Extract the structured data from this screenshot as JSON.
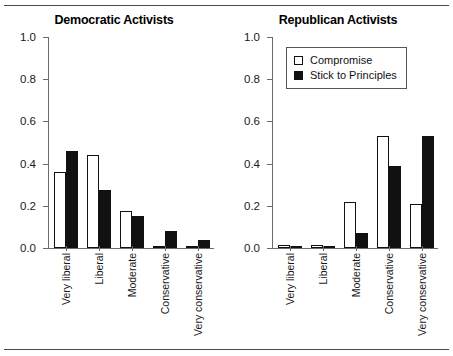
{
  "figure": {
    "rule_top": "horizontal-rule",
    "rule_bottom": "horizontal-rule"
  },
  "chart_data": [
    {
      "type": "bar",
      "title": "Democratic Activists",
      "xlabel": "",
      "ylabel": "",
      "ylim": [
        0.0,
        1.0
      ],
      "yticks": [
        "0.0",
        "0.2",
        "0.4",
        "0.6",
        "0.8",
        "1.0"
      ],
      "ytick_values": [
        0.0,
        0.2,
        0.4,
        0.6,
        0.8,
        1.0
      ],
      "grid": false,
      "legend": false,
      "categories": [
        "Very liberal",
        "Liberal",
        "Moderate",
        "Conservative",
        "Very conservative"
      ],
      "series": [
        {
          "name": "Compromise",
          "fill": "open",
          "values": [
            0.36,
            0.44,
            0.175,
            0.01,
            0.01
          ]
        },
        {
          "name": "Stick to Principles",
          "fill": "solid",
          "values": [
            0.46,
            0.275,
            0.15,
            0.08,
            0.04
          ]
        }
      ]
    },
    {
      "type": "bar",
      "title": "Republican Activists",
      "xlabel": "",
      "ylabel": "",
      "ylim": [
        0.0,
        1.0
      ],
      "yticks": [
        "0.0",
        "0.2",
        "0.4",
        "0.6",
        "0.8",
        "1.0"
      ],
      "ytick_values": [
        0.0,
        0.2,
        0.4,
        0.6,
        0.8,
        1.0
      ],
      "grid": false,
      "legend": true,
      "legend_position": "top-left",
      "legend_entries": [
        "Compromise",
        "Stick to Principles"
      ],
      "categories": [
        "Very liberal",
        "Liberal",
        "Moderate",
        "Conservative",
        "Very conservative"
      ],
      "series": [
        {
          "name": "Compromise",
          "fill": "open",
          "values": [
            0.012,
            0.012,
            0.22,
            0.53,
            0.21
          ]
        },
        {
          "name": "Stick to Principles",
          "fill": "solid",
          "values": [
            0.006,
            0.006,
            0.07,
            0.39,
            0.53
          ]
        }
      ]
    }
  ],
  "colors": {
    "open_fill": "#ffffff",
    "solid_fill": "#111111",
    "bar_edge": "#111111",
    "axis": "#6b6b6b",
    "text": "#1a1a1a",
    "rule": "#4a4a4a"
  }
}
